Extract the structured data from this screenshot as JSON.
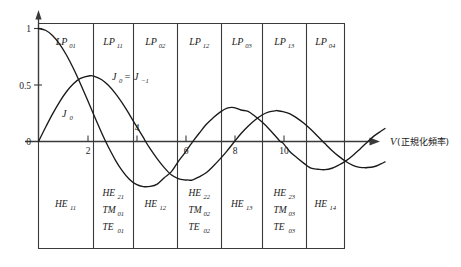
{
  "figure": {
    "title": "",
    "axis": {
      "x_label_symbol": "V",
      "x_label_paren": "(正規化頻率)",
      "x_ticks": [
        "2",
        "4",
        "6",
        "8",
        "10"
      ],
      "y_ticks": [
        "1",
        "0.5",
        "0"
      ]
    },
    "annotations": [
      {
        "name": "curve-label-j0",
        "text": "J",
        "sub": "0"
      },
      {
        "name": "curve-label-j0-eq-jm1",
        "text": "J",
        "sub": "0",
        "eq": "=",
        "text2": "J",
        "sub2": "−1"
      }
    ],
    "columns": [
      {
        "top_mode": "LP",
        "top_sub": "01",
        "bottom": [
          {
            "sym": "HE",
            "sub": "11"
          }
        ]
      },
      {
        "top_mode": "LP",
        "top_sub": "11",
        "bottom": [
          {
            "sym": "HE",
            "sub": "21"
          },
          {
            "sym": "TM",
            "sub": "01"
          },
          {
            "sym": "TE",
            "sub": "01"
          }
        ]
      },
      {
        "top_mode": "LP",
        "top_sub": "02",
        "bottom": [
          {
            "sym": "HE",
            "sub": "12"
          }
        ]
      },
      {
        "top_mode": "LP",
        "top_sub": "12",
        "bottom": [
          {
            "sym": "HE",
            "sub": "22"
          },
          {
            "sym": "TM",
            "sub": "02"
          },
          {
            "sym": "TE",
            "sub": "02"
          }
        ]
      },
      {
        "top_mode": "LP",
        "top_sub": "03",
        "bottom": [
          {
            "sym": "HE",
            "sub": "13"
          }
        ]
      },
      {
        "top_mode": "LP",
        "top_sub": "13",
        "bottom": [
          {
            "sym": "HE",
            "sub": "23"
          },
          {
            "sym": "TM",
            "sub": "03"
          },
          {
            "sym": "TE",
            "sub": "03"
          }
        ]
      },
      {
        "top_mode": "LP",
        "top_sub": "04",
        "bottom": [
          {
            "sym": "HE",
            "sub": "14"
          }
        ]
      }
    ]
  },
  "chart_data": {
    "type": "line",
    "title": "",
    "xlabel": "V (正規化頻率)",
    "ylabel": "",
    "xlim": [
      0,
      12.4
    ],
    "ylim": [
      -0.42,
      1.05
    ],
    "grid": false,
    "legend": "none",
    "x_ticks": [
      2,
      4,
      6,
      8,
      10
    ],
    "y_ticks": [
      0,
      0.5,
      1
    ],
    "series": [
      {
        "name": "J_0",
        "label": "J₀",
        "x": [
          0,
          0.25,
          0.5,
          0.75,
          1,
          1.25,
          1.5,
          1.75,
          2,
          2.25,
          2.4048,
          2.5,
          2.75,
          3,
          3.25,
          3.5,
          3.75,
          4,
          4.25,
          4.5,
          4.75,
          5,
          5.25,
          5.5,
          5.5201,
          5.75,
          6,
          6.25,
          6.5,
          6.75,
          7,
          7.25,
          7.5,
          7.75,
          8,
          8.25,
          8.5,
          8.6537,
          8.75,
          9,
          9.25,
          9.5,
          9.75,
          10,
          10.25,
          10.5,
          10.75,
          11,
          11.25,
          11.5,
          11.7915,
          12,
          12.25,
          12.4
        ],
        "y": [
          1.0,
          0.9844,
          0.9385,
          0.8642,
          0.7652,
          0.6459,
          0.5118,
          0.369,
          0.2239,
          0.0827,
          0.0,
          -0.0484,
          -0.1641,
          -0.2601,
          -0.3343,
          -0.3801,
          -0.3992,
          -0.3971,
          -0.3766,
          -0.3205,
          -0.2693,
          -0.1776,
          -0.0968,
          -0.0068,
          0.0,
          0.0733,
          0.1506,
          0.2095,
          0.2601,
          0.2951,
          0.3001,
          0.2786,
          0.2663,
          0.2235,
          0.1717,
          0.1107,
          0.0419,
          0.0,
          -0.0142,
          -0.0903,
          -0.1442,
          -0.1939,
          -0.2366,
          -0.2459,
          -0.2496,
          -0.2366,
          -0.2078,
          -0.1712,
          -0.1234,
          -0.0677,
          0.0,
          0.0477,
          0.0908,
          0.115
        ]
      },
      {
        "name": "J_1",
        "label": "J₀ = J₋₁",
        "x": [
          0,
          0.25,
          0.5,
          0.75,
          1,
          1.25,
          1.5,
          1.8412,
          2,
          2.25,
          2.5,
          2.75,
          3,
          3.25,
          3.5,
          3.75,
          3.8317,
          4,
          4.25,
          4.5,
          4.75,
          5,
          5.25,
          5.3314,
          5.5,
          5.75,
          6,
          6.25,
          6.5,
          6.75,
          7,
          7.0156,
          7.25,
          7.5,
          7.75,
          8,
          8.25,
          8.5,
          8.5363,
          8.75,
          9,
          9.25,
          9.5,
          9.75,
          10,
          10.1735,
          10.25,
          10.5,
          10.75,
          11,
          11.25,
          11.5,
          11.75,
          11.7,
          12,
          12.25,
          12.4
        ],
        "y": [
          0.0,
          0.124,
          0.2423,
          0.3492,
          0.4401,
          0.5106,
          0.5579,
          0.5819,
          0.5767,
          0.5484,
          0.4971,
          0.426,
          0.3391,
          0.2404,
          0.1374,
          0.0371,
          0.0,
          -0.066,
          -0.1538,
          -0.2311,
          -0.294,
          -0.3276,
          -0.3404,
          -0.3403,
          -0.3414,
          -0.3123,
          -0.2767,
          -0.219,
          -0.1538,
          -0.0826,
          -0.0047,
          0.0,
          0.071,
          0.1352,
          0.1896,
          0.2346,
          0.2612,
          0.2731,
          0.273,
          0.264,
          0.2453,
          0.2072,
          0.1613,
          0.1053,
          0.0435,
          0.0,
          -0.0184,
          -0.0789,
          -0.1318,
          -0.1768,
          -0.2103,
          -0.2284,
          -0.232,
          -0.2316,
          -0.2234,
          -0.1986,
          -0.18
        ]
      }
    ]
  }
}
